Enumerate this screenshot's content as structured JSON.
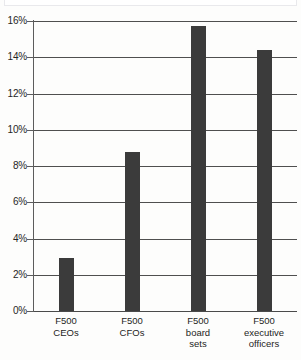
{
  "chart_data": {
    "type": "bar",
    "title": "",
    "subtitle": "",
    "xlabel": "",
    "ylabel": "",
    "categories": [
      "F500\nCEOs",
      "F500\nCFOs",
      "F500\nboard\nsets",
      "F500\nexecutive\nofficers"
    ],
    "category_lines": [
      [
        "F500",
        "CEOs"
      ],
      [
        "F500",
        "CFOs"
      ],
      [
        "F500",
        "board",
        "sets"
      ],
      [
        "F500",
        "executive",
        "officers"
      ]
    ],
    "values": [
      2.95,
      8.75,
      15.7,
      14.4
    ],
    "value_labels": [
      "2.95%",
      "8.75%",
      "15.7%",
      "14.4%"
    ],
    "ylim": [
      0,
      16
    ],
    "ytick_values": [
      0,
      2,
      4,
      6,
      8,
      10,
      12,
      14,
      16
    ],
    "ytick_labels": [
      "0%",
      "2%",
      "4%",
      "6%",
      "8%",
      "10%",
      "12%",
      "14%",
      "16%"
    ],
    "grid": true,
    "legend": false,
    "legend_position": "none",
    "bar_color": "#3b3b3b",
    "axis_color": "#4f4f4f",
    "background_color": "#fdfdfc"
  }
}
